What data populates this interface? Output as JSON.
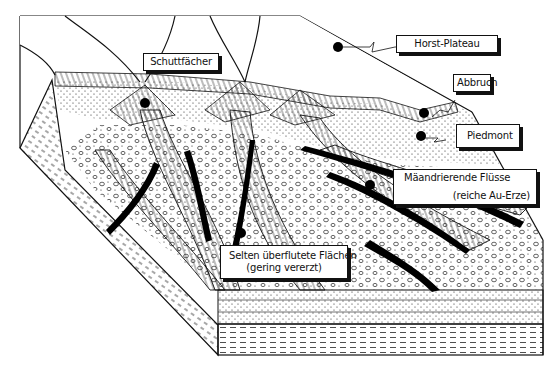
{
  "figure": {
    "type": "geological block diagram",
    "language": "German"
  },
  "labels": {
    "horst_plateau": "Horst-Plateau",
    "schuttfaecher": "Schuttfächer",
    "abbruch": "Abbruch",
    "piedmont": "Piedmont",
    "maeandrierende_fluesse": "Mäandrierende  Flüsse",
    "reiche_au_erze": "(reiche Au-Erze)",
    "selten_ueberflutete": "Selten überflutete Flächen",
    "gering_vererzt": "(gering vererzt)"
  },
  "colors": {
    "ink": "#111111",
    "paper": "#ffffff"
  }
}
